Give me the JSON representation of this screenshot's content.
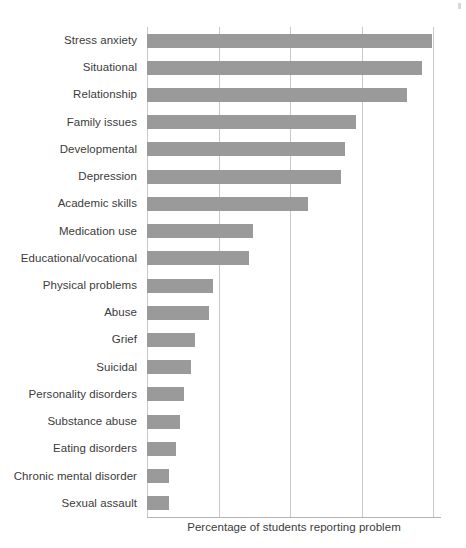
{
  "chart_data": {
    "type": "bar",
    "orientation": "horizontal",
    "title": "",
    "subtitle": "",
    "xlabel": "Percentage of students reporting problem",
    "ylabel": "",
    "grid": true,
    "legend": null,
    "legend_position": "none",
    "xlim": [
      0,
      100
    ],
    "x_tick_labels": [],
    "gridline_count": 5,
    "bar_color": "#9a9a9a",
    "gridline_color": "#c9c9c9",
    "axis_color": "#b5b5b5",
    "text_color": "#3b3b3b",
    "categories": [
      "Stress anxiety",
      "Situational",
      "Relationship",
      "Family issues",
      "Developmental",
      "Depression",
      "Academic skills",
      "Medication use",
      "Educational/vocational",
      "Physical problems",
      "Abuse",
      "Grief",
      "Suicidal",
      "Personality disorders",
      "Substance abuse",
      "Eating disorders",
      "Chronic mental disorder",
      "Sexual assault"
    ],
    "values": [
      78,
      75,
      71,
      57,
      54,
      53,
      44,
      29,
      28,
      18,
      17,
      13,
      12,
      10,
      9,
      8,
      6,
      6
    ]
  },
  "axis": {
    "title": "Percentage of students reporting problem"
  }
}
